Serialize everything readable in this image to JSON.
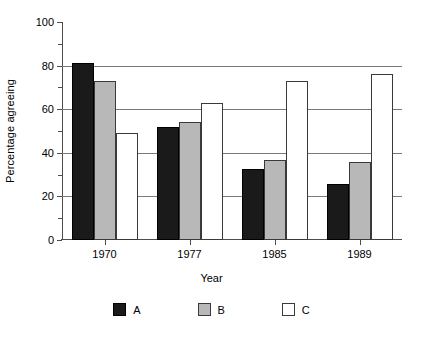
{
  "chart_data": {
    "type": "bar",
    "title": "",
    "xlabel": "Year",
    "ylabel": "Percentage agreeing",
    "categories": [
      "1970",
      "1977",
      "1985",
      "1989"
    ],
    "series": [
      {
        "name": "A",
        "color": "#1a1a1a",
        "values": [
          81,
          52,
          32.5,
          25.5
        ]
      },
      {
        "name": "B",
        "color": "#b8b8b8",
        "values": [
          73,
          54,
          36.5,
          36
        ]
      },
      {
        "name": "C",
        "color": "#ffffff",
        "values": [
          49,
          63,
          73,
          76
        ]
      }
    ],
    "ylim": [
      0,
      100
    ],
    "ytick_labels": [
      "0",
      "20",
      "40",
      "60",
      "80",
      "100"
    ],
    "ytick_values": [
      0,
      20,
      40,
      60,
      80,
      100
    ],
    "yminor_values": [
      10,
      30,
      50,
      70,
      90
    ],
    "grid": "horizontal",
    "gridline_values": [
      20,
      40,
      60,
      80
    ],
    "legend_position": "bottom",
    "legend_entries": [
      "A",
      "B",
      "C"
    ]
  }
}
